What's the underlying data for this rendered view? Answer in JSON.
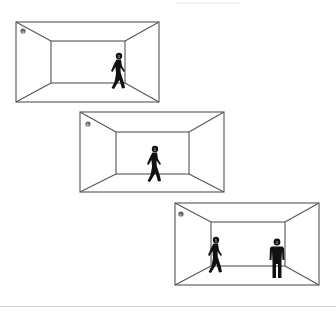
{
  "figure": {
    "panels": [
      {
        "id": "a",
        "label": "a",
        "description": "Room perspective view with one walking person near the right back wall",
        "outer": {
          "x": 16,
          "y": 22,
          "w": 143,
          "h": 80
        },
        "inner": {
          "x": 51,
          "y": 41,
          "w": 74,
          "h": 42
        },
        "people": [
          {
            "type": "walking",
            "label": "1",
            "x": 117,
            "y": 52
          }
        ]
      },
      {
        "id": "b",
        "label": "b",
        "description": "Room perspective view with one walking person in the center",
        "outer": {
          "x": 80,
          "y": 112,
          "w": 144,
          "h": 80
        },
        "inner": {
          "x": 116,
          "y": 132,
          "w": 73,
          "h": 42
        },
        "people": [
          {
            "type": "walking",
            "label": "1",
            "x": 153,
            "y": 145
          }
        ]
      },
      {
        "id": "c",
        "label": "c",
        "description": "Room perspective view with one walking person on the left and one standing person on the right",
        "outer": {
          "x": 175,
          "y": 203,
          "w": 144,
          "h": 82
        },
        "inner": {
          "x": 211,
          "y": 222,
          "w": 74,
          "h": 44
        },
        "people": [
          {
            "type": "walking",
            "label": "1",
            "x": 215,
            "y": 233
          },
          {
            "type": "standing",
            "label": "2",
            "x": 277,
            "y": 237
          }
        ]
      }
    ],
    "colors": {
      "lines": "#555555",
      "figures": "#111111",
      "rule": "#cfcfcf"
    }
  }
}
